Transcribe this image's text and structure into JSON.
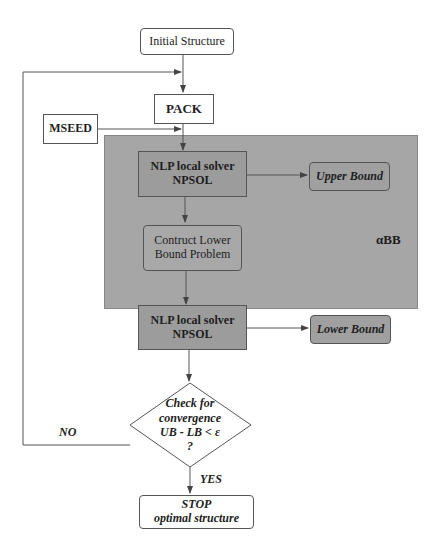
{
  "nodes": {
    "initial_structure": "Initial Structure",
    "pack": "PACK",
    "mseed": "MSEED",
    "nlp_upper": {
      "line1": "NLP local solver",
      "line2": "NPSOL"
    },
    "upper_bound": "Upper Bound",
    "construct_lower": {
      "line1": "Contruct  Lower",
      "line2": "Bound Problem"
    },
    "nlp_lower": {
      "line1": "NLP local solver",
      "line2": "NPSOL"
    },
    "lower_bound": "Lower Bound",
    "check": {
      "line1": "Check for",
      "line2": "convergence",
      "line3": "UB - LB <  ε",
      "line4": "?"
    },
    "stop": {
      "line1": "STOP",
      "line2": "optimal structure"
    }
  },
  "labels": {
    "abb": "αBB",
    "no": "NO",
    "yes": "YES"
  },
  "colors": {
    "panel": "#a6a6a6",
    "box_fill_dark": "#9c9c9c",
    "box_fill_light": "#ffffff",
    "line": "#555555"
  }
}
